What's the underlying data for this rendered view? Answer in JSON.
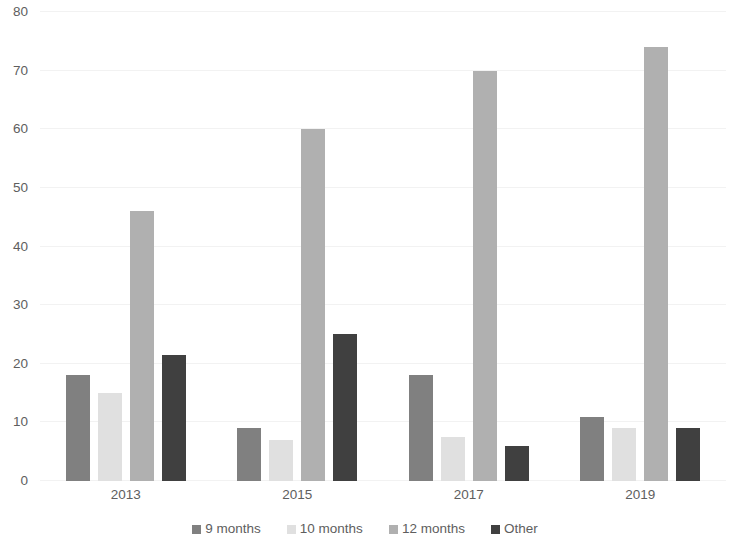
{
  "chart_data": {
    "type": "bar",
    "title": "",
    "subtitle": "",
    "xlabel": "",
    "ylabel": "",
    "categories": [
      "2013",
      "2015",
      "2017",
      "2019"
    ],
    "series": [
      {
        "name": "9 months",
        "color": "#808080",
        "values": [
          18,
          9,
          18,
          11
        ]
      },
      {
        "name": "10 months",
        "color": "#e0e0e0",
        "values": [
          15,
          7,
          7.5,
          9
        ]
      },
      {
        "name": "12 months",
        "color": "#b0b0b0",
        "values": [
          46,
          60,
          70,
          74
        ]
      },
      {
        "name": "Other",
        "color": "#404040",
        "values": [
          21.5,
          25,
          6,
          9
        ]
      }
    ],
    "ylim": [
      0,
      80
    ],
    "yticks": [
      0,
      10,
      20,
      30,
      40,
      50,
      60,
      70,
      80
    ],
    "ytick_labels": [
      "0",
      "10",
      "20",
      "30",
      "40",
      "50",
      "60",
      "70",
      "80"
    ],
    "grid": true,
    "grid_axis": "y",
    "legend_position": "bottom",
    "bar_orientation": "vertical",
    "group_count": 4,
    "series_count": 4
  },
  "legend": {
    "items": [
      {
        "label": "9 months",
        "color": "#808080"
      },
      {
        "label": "10 months",
        "color": "#e0e0e0"
      },
      {
        "label": "12 months",
        "color": "#b0b0b0"
      },
      {
        "label": "Other",
        "color": "#404040"
      }
    ]
  },
  "axes": {
    "y_tick_labels": [
      "80",
      "70",
      "60",
      "50",
      "40",
      "30",
      "20",
      "10",
      "0"
    ],
    "x_tick_labels": [
      "2013",
      "2015",
      "2017",
      "2019"
    ]
  }
}
